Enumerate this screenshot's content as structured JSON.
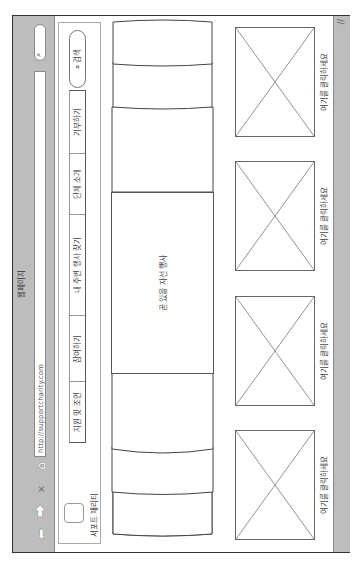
{
  "window": {
    "title": "웹페이지",
    "url": "http://supportcharity.com",
    "search_icon": "search-icon",
    "nav_icons": [
      "back-arrow-icon",
      "forward-arrow-icon",
      "close-icon",
      "home-icon"
    ]
  },
  "header": {
    "logo_text": "서포트 채리티",
    "tabs": [
      {
        "label": "지원 및 조언"
      },
      {
        "label": "참여하기"
      },
      {
        "label": "내 주변 행사 찾기"
      },
      {
        "label": "단체 소개"
      },
      {
        "label": "기부하기"
      }
    ],
    "search_label": "검색"
  },
  "carousel": {
    "featured_label": "곧 있을 자선 행사"
  },
  "placeholders": [
    {
      "label": "여기를 클릭하세요"
    },
    {
      "label": "여기를 클릭하세요"
    },
    {
      "label": "여기를 클릭하세요"
    },
    {
      "label": "여기를 클릭하세요"
    }
  ]
}
